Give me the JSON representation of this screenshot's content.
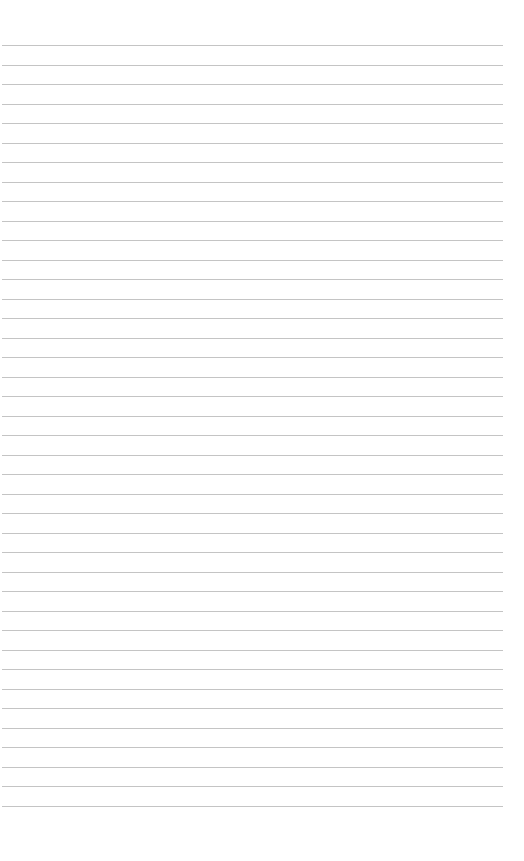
{
  "page": {
    "type": "lined-paper",
    "line_count": 40,
    "first_line_y": 45,
    "line_spacing": 19.5,
    "line_left": 2,
    "line_width": 501,
    "line_color": "#c4c4c4",
    "background": "#ffffff",
    "text": ""
  }
}
